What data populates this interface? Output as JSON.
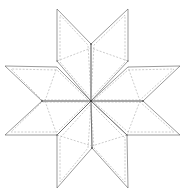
{
  "diagram": {
    "title": "",
    "type": "eight-point-star-quilt-template",
    "colors": {
      "outline": "#555555",
      "seam": "#999999",
      "background": "#ffffff"
    },
    "center": [
      91,
      101
    ],
    "points": 8,
    "labels": [
      "",
      "",
      "",
      "",
      "",
      "",
      "",
      ""
    ]
  }
}
